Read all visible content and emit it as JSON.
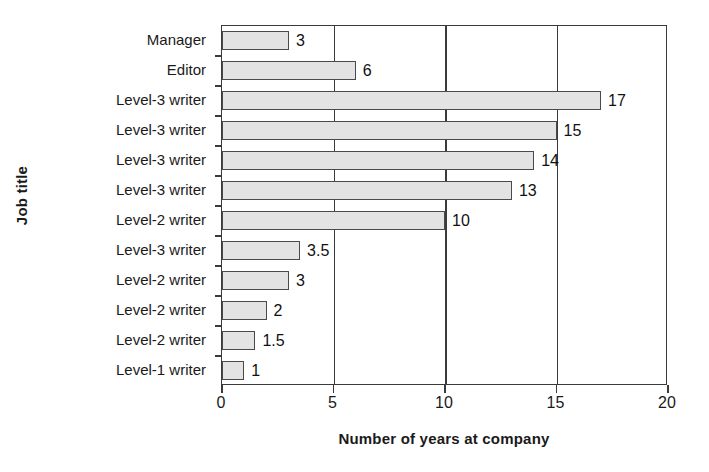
{
  "chart_data": {
    "type": "bar",
    "orientation": "horizontal",
    "title": "",
    "xlabel": "Number of years at company",
    "ylabel": "Job title",
    "categories": [
      "Manager",
      "Editor",
      "Level-3 writer",
      "Level-3 writer",
      "Level-3 writer",
      "Level-3 writer",
      "Level-2 writer",
      "Level-3 writer",
      "Level-2 writer",
      "Level-2 writer",
      "Level-2 writer",
      "Level-1 writer"
    ],
    "values": [
      3,
      6,
      17,
      15,
      14,
      13,
      10,
      3.5,
      3,
      2,
      1.5,
      1
    ],
    "value_labels": [
      "3",
      "6",
      "17",
      "15",
      "14",
      "13",
      "10",
      "3.5",
      "3",
      "2",
      "1.5",
      "1"
    ],
    "xlim": [
      0,
      20
    ],
    "xticks": [
      0,
      5,
      10,
      15,
      20
    ],
    "xtick_labels": [
      "0",
      "5",
      "10",
      "15",
      "20"
    ],
    "gridlines": [
      5,
      10,
      15
    ],
    "grid": true,
    "legend": null,
    "bar_fill_color": "#e3e3e3",
    "bar_border_color": "#4a4a4a",
    "axis_color": "#3b3b3b",
    "background_color": "#ffffff"
  }
}
